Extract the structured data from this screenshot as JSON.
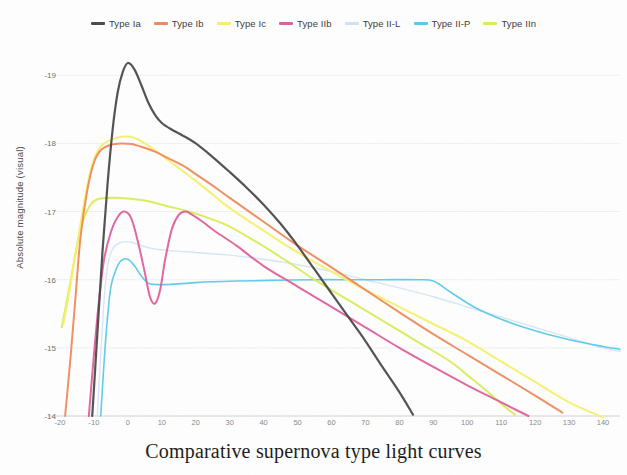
{
  "title": "Comparative supernova type light curves",
  "axes": {
    "ylabel": "Absolute magnitude (visual)",
    "xlabel": "",
    "yticks": [
      "-19",
      "-18",
      "-17",
      "-16",
      "-15",
      "-14"
    ],
    "xticks": [
      "-20",
      "-10",
      "0",
      "10",
      "20",
      "30",
      "40",
      "50",
      "60",
      "70",
      "80",
      "90",
      "100",
      "110",
      "120",
      "130",
      "140"
    ]
  },
  "legend": [
    {
      "label": "Type Ia",
      "color": "#4a4a4a"
    },
    {
      "label": "Type Ib",
      "color": "#f08a5d"
    },
    {
      "label": "Type Ic",
      "color": "#f5f06a"
    },
    {
      "label": "Type IIb",
      "color": "#e0609a"
    },
    {
      "label": "Type II-L",
      "color": "#cfe3f2"
    },
    {
      "label": "Type II-P",
      "color": "#5bc8ea"
    },
    {
      "label": "Type IIn",
      "color": "#d9ec5a"
    }
  ],
  "chart_data": {
    "type": "line",
    "title": "Comparative supernova type light curves",
    "xlabel": "",
    "ylabel": "Absolute magnitude (visual)",
    "xlim": [
      -20,
      145
    ],
    "ylim": [
      -14,
      -19.4
    ],
    "y_inverted": true,
    "grid": false,
    "legend_position": "top",
    "x_tick_values": [
      -20,
      -10,
      0,
      10,
      20,
      30,
      40,
      50,
      60,
      70,
      80,
      90,
      100,
      110,
      120,
      130,
      140
    ],
    "y_tick_values": [
      -19,
      -18,
      -17,
      -16,
      -15,
      -14
    ],
    "series": [
      {
        "name": "Type Ia",
        "color": "#4a4a4a",
        "points": [
          [
            -10.5,
            -14.0
          ],
          [
            -9,
            -15.2
          ],
          [
            -7.5,
            -16.4
          ],
          [
            -6,
            -17.4
          ],
          [
            -4.5,
            -18.2
          ],
          [
            -3,
            -18.75
          ],
          [
            -1.5,
            -19.05
          ],
          [
            0,
            -19.18
          ],
          [
            2,
            -19.08
          ],
          [
            4,
            -18.85
          ],
          [
            6,
            -18.6
          ],
          [
            8,
            -18.42
          ],
          [
            10,
            -18.3
          ],
          [
            13,
            -18.2
          ],
          [
            16,
            -18.12
          ],
          [
            20,
            -18.0
          ],
          [
            25,
            -17.8
          ],
          [
            30,
            -17.58
          ],
          [
            35,
            -17.35
          ],
          [
            40,
            -17.1
          ],
          [
            45,
            -16.82
          ],
          [
            50,
            -16.5
          ],
          [
            55,
            -16.15
          ],
          [
            60,
            -15.8
          ],
          [
            65,
            -15.45
          ],
          [
            70,
            -15.1
          ],
          [
            75,
            -14.72
          ],
          [
            80,
            -14.35
          ],
          [
            84,
            -14.02
          ]
        ]
      },
      {
        "name": "Type Ib",
        "color": "#f08a5d",
        "points": [
          [
            -18.5,
            -14.0
          ],
          [
            -17,
            -14.8
          ],
          [
            -15.5,
            -15.7
          ],
          [
            -14,
            -16.6
          ],
          [
            -12,
            -17.3
          ],
          [
            -10,
            -17.72
          ],
          [
            -8,
            -17.9
          ],
          [
            -5,
            -17.98
          ],
          [
            -2,
            -18.0
          ],
          [
            1,
            -17.99
          ],
          [
            4,
            -17.95
          ],
          [
            8,
            -17.88
          ],
          [
            12,
            -17.78
          ],
          [
            16,
            -17.68
          ],
          [
            20,
            -17.55
          ],
          [
            25,
            -17.38
          ],
          [
            30,
            -17.2
          ],
          [
            40,
            -16.85
          ],
          [
            50,
            -16.5
          ],
          [
            60,
            -16.18
          ],
          [
            70,
            -15.85
          ],
          [
            80,
            -15.52
          ],
          [
            90,
            -15.2
          ],
          [
            100,
            -14.9
          ],
          [
            110,
            -14.6
          ],
          [
            120,
            -14.3
          ],
          [
            128,
            -14.05
          ]
        ]
      },
      {
        "name": "Type Ic",
        "color": "#f5f06a",
        "points": [
          [
            -19,
            -15.35
          ],
          [
            -17,
            -15.9
          ],
          [
            -15,
            -16.5
          ],
          [
            -13,
            -17.1
          ],
          [
            -11,
            -17.6
          ],
          [
            -9,
            -17.88
          ],
          [
            -7,
            -18.0
          ],
          [
            -4,
            -18.07
          ],
          [
            -1,
            -18.1
          ],
          [
            2,
            -18.08
          ],
          [
            5,
            -18.0
          ],
          [
            8,
            -17.9
          ],
          [
            12,
            -17.75
          ],
          [
            16,
            -17.6
          ],
          [
            20,
            -17.45
          ],
          [
            25,
            -17.25
          ],
          [
            30,
            -17.05
          ],
          [
            40,
            -16.72
          ],
          [
            50,
            -16.4
          ],
          [
            60,
            -16.12
          ],
          [
            70,
            -15.85
          ],
          [
            80,
            -15.6
          ],
          [
            90,
            -15.35
          ],
          [
            100,
            -15.1
          ],
          [
            110,
            -14.8
          ],
          [
            120,
            -14.5
          ],
          [
            130,
            -14.2
          ],
          [
            140,
            -13.98
          ]
        ]
      },
      {
        "name": "Type IIb",
        "color": "#e0609a",
        "points": [
          [
            -11.5,
            -14.0
          ],
          [
            -10,
            -14.9
          ],
          [
            -8.5,
            -15.7
          ],
          [
            -7,
            -16.3
          ],
          [
            -5,
            -16.7
          ],
          [
            -3,
            -16.92
          ],
          [
            -1,
            -17.0
          ],
          [
            1,
            -16.9
          ],
          [
            3,
            -16.55
          ],
          [
            5,
            -16.1
          ],
          [
            6.5,
            -15.75
          ],
          [
            8,
            -15.65
          ],
          [
            9.5,
            -15.85
          ],
          [
            11,
            -16.3
          ],
          [
            13,
            -16.75
          ],
          [
            15,
            -16.95
          ],
          [
            17,
            -17.0
          ],
          [
            19,
            -16.95
          ],
          [
            22,
            -16.85
          ],
          [
            26,
            -16.7
          ],
          [
            32,
            -16.5
          ],
          [
            40,
            -16.2
          ],
          [
            50,
            -15.9
          ],
          [
            60,
            -15.6
          ],
          [
            70,
            -15.3
          ],
          [
            80,
            -15.0
          ],
          [
            90,
            -14.72
          ],
          [
            100,
            -14.45
          ],
          [
            110,
            -14.2
          ],
          [
            118,
            -14.0
          ]
        ]
      },
      {
        "name": "Type II-L",
        "color": "#cfe3f2",
        "points": [
          [
            -9,
            -14.0
          ],
          [
            -8,
            -14.9
          ],
          [
            -7,
            -15.7
          ],
          [
            -6,
            -16.2
          ],
          [
            -4.5,
            -16.45
          ],
          [
            -2,
            -16.55
          ],
          [
            1,
            -16.55
          ],
          [
            4,
            -16.5
          ],
          [
            8,
            -16.45
          ],
          [
            14,
            -16.42
          ],
          [
            20,
            -16.4
          ],
          [
            30,
            -16.36
          ],
          [
            40,
            -16.3
          ],
          [
            50,
            -16.22
          ],
          [
            60,
            -16.12
          ],
          [
            70,
            -16.0
          ],
          [
            80,
            -15.88
          ],
          [
            90,
            -15.75
          ],
          [
            100,
            -15.6
          ],
          [
            110,
            -15.45
          ],
          [
            120,
            -15.3
          ],
          [
            130,
            -15.15
          ],
          [
            140,
            -15.0
          ],
          [
            145,
            -14.95
          ]
        ]
      },
      {
        "name": "Type II-P",
        "color": "#5bc8ea",
        "points": [
          [
            -8,
            -14.0
          ],
          [
            -7,
            -14.8
          ],
          [
            -6,
            -15.45
          ],
          [
            -5,
            -15.9
          ],
          [
            -3.5,
            -16.15
          ],
          [
            -2,
            -16.28
          ],
          [
            0,
            -16.3
          ],
          [
            2,
            -16.2
          ],
          [
            4,
            -16.05
          ],
          [
            6,
            -15.95
          ],
          [
            8,
            -15.93
          ],
          [
            12,
            -15.93
          ],
          [
            18,
            -15.95
          ],
          [
            24,
            -15.97
          ],
          [
            32,
            -15.98
          ],
          [
            42,
            -15.99
          ],
          [
            55,
            -16.0
          ],
          [
            65,
            -16.0
          ],
          [
            75,
            -16.0
          ],
          [
            85,
            -16.0
          ],
          [
            90,
            -15.98
          ],
          [
            95,
            -15.82
          ],
          [
            102,
            -15.6
          ],
          [
            110,
            -15.42
          ],
          [
            120,
            -15.25
          ],
          [
            130,
            -15.12
          ],
          [
            140,
            -15.02
          ],
          [
            145,
            -14.98
          ]
        ]
      },
      {
        "name": "Type IIn",
        "color": "#d9ec5a",
        "points": [
          [
            -19.5,
            -15.3
          ],
          [
            -17,
            -15.95
          ],
          [
            -15,
            -16.5
          ],
          [
            -13,
            -16.9
          ],
          [
            -11,
            -17.1
          ],
          [
            -9,
            -17.18
          ],
          [
            -6,
            -17.2
          ],
          [
            -2,
            -17.2
          ],
          [
            2,
            -17.18
          ],
          [
            6,
            -17.15
          ],
          [
            10,
            -17.1
          ],
          [
            14,
            -17.05
          ],
          [
            18,
            -17.0
          ],
          [
            24,
            -16.9
          ],
          [
            30,
            -16.78
          ],
          [
            38,
            -16.55
          ],
          [
            46,
            -16.3
          ],
          [
            55,
            -16.0
          ],
          [
            65,
            -15.7
          ],
          [
            75,
            -15.4
          ],
          [
            85,
            -15.1
          ],
          [
            95,
            -14.8
          ],
          [
            100,
            -14.6
          ],
          [
            105,
            -14.4
          ],
          [
            110,
            -14.18
          ],
          [
            114,
            -14.02
          ]
        ]
      }
    ]
  }
}
